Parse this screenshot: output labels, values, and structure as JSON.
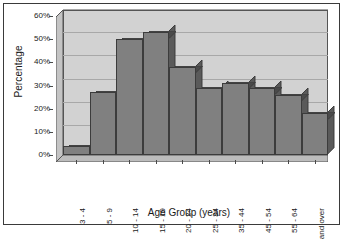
{
  "chart_data": {
    "type": "bar",
    "title": "",
    "xlabel": "Age Group (years)",
    "ylabel": "Percentage",
    "categories": [
      "3 - 4",
      "5 - 9",
      "10 - 14",
      "15 - 19",
      "20 - 24",
      "25 - 34",
      "35 - 44",
      "45 - 54",
      "55 - 64",
      "65 and over"
    ],
    "values": [
      4,
      27,
      50,
      53,
      38,
      29,
      31,
      29,
      26,
      18
    ],
    "ylim": [
      0,
      60
    ],
    "yticks": [
      0,
      10,
      20,
      30,
      40,
      50,
      60
    ],
    "ytick_labels": [
      "0%",
      "10%",
      "20%",
      "30%",
      "40%",
      "50%",
      "60%"
    ],
    "grid": true,
    "legend": "none",
    "style": "3d-column"
  },
  "colors": {
    "bar_face": "#808080",
    "bar_top": "#4a4a4a",
    "bar_side": "#5a5a5a",
    "bar_outline": "#3c3c3c",
    "plot_background": "#d2d2d2",
    "floor": "#bcbcbc",
    "sidewall": "#c4c4c4",
    "gridline": "#a8a8a8",
    "axis": "#4a4a4a",
    "frame_border": "#3a3a3a",
    "page_background": "#ffffff",
    "text": "#1a1a1a"
  }
}
